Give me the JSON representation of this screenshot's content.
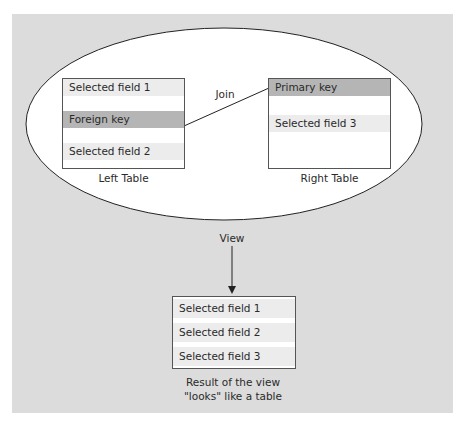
{
  "diagram": {
    "join_label": "Join",
    "view_label": "View",
    "left_table": {
      "caption": "Left Table",
      "fields": [
        "Selected field 1",
        "Foreign key",
        "Selected field 2"
      ]
    },
    "right_table": {
      "caption": "Right Table",
      "fields": [
        "Primary key",
        "Selected field 3"
      ]
    },
    "result_table": {
      "fields": [
        "Selected field 1",
        "Selected field 2",
        "Selected field 3"
      ],
      "caption_line1": "Result of the view",
      "caption_line2": "\"looks\" like a table"
    }
  },
  "colors": {
    "background": "#dcdcdc",
    "key_row": "#b5b5b5",
    "field_row": "#ececec"
  }
}
